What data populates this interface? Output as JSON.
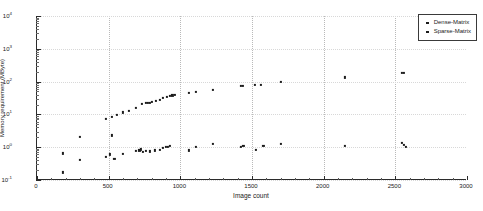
{
  "chart_data": {
    "type": "scatter",
    "title": "",
    "xlabel": "Image count",
    "ylabel": "Memory requirement (MByte)",
    "xlim": [
      0,
      3000
    ],
    "ylim": [
      0.1,
      10000
    ],
    "yscale": "log",
    "xscale": "linear",
    "grid": true,
    "grid_axis": "x",
    "legend_position": "top-right",
    "xticks": [
      0,
      500,
      1000,
      1500,
      2000,
      2500,
      3000
    ],
    "xticklabels": [
      "0",
      "500",
      "1000",
      "1500",
      "2000",
      "2500",
      "3000"
    ],
    "yticks": [
      0.1,
      1,
      10,
      100,
      1000,
      10000
    ],
    "yticklabels": [
      "10-1",
      "100",
      "101",
      "102",
      "103",
      "104"
    ],
    "ytick_exponents": [
      -1,
      0,
      1,
      2,
      3,
      4
    ],
    "series": [
      {
        "name": "Dense-Matrix",
        "marker": "square",
        "color": "#1c1c1c",
        "points": [
          [
            180,
            0.65
          ],
          [
            300,
            2.1
          ],
          [
            480,
            7.2
          ],
          [
            520,
            8.6
          ],
          [
            560,
            9.5
          ],
          [
            600,
            11.5
          ],
          [
            640,
            13.0
          ],
          [
            690,
            15.5
          ],
          [
            730,
            21.0
          ],
          [
            760,
            22.0
          ],
          [
            775,
            22.5
          ],
          [
            790,
            23.0
          ],
          [
            800,
            23.5
          ],
          [
            830,
            26.0
          ],
          [
            855,
            28.0
          ],
          [
            880,
            31.0
          ],
          [
            905,
            34.0
          ],
          [
            925,
            36.0
          ],
          [
            945,
            38.0
          ],
          [
            960,
            39.0
          ],
          [
            1060,
            45.0
          ],
          [
            1110,
            48.0
          ],
          [
            1230,
            55.0
          ],
          [
            1420,
            72.0
          ],
          [
            1435,
            73.0
          ],
          [
            1520,
            78.0
          ],
          [
            1560,
            80.0
          ],
          [
            1700,
            98.0
          ],
          [
            2150,
            135.0
          ],
          [
            2545,
            180.0
          ],
          [
            2560,
            182.0
          ]
        ]
      },
      {
        "name": "Sparse-Matrix",
        "marker": "square",
        "color": "#1c1c1c",
        "points": [
          [
            180,
            0.17
          ],
          [
            300,
            0.42
          ],
          [
            480,
            0.52
          ],
          [
            510,
            0.6
          ],
          [
            525,
            2.3
          ],
          [
            540,
            0.45
          ],
          [
            600,
            0.62
          ],
          [
            690,
            0.75
          ],
          [
            715,
            0.8
          ],
          [
            725,
            0.86
          ],
          [
            740,
            0.72
          ],
          [
            760,
            0.78
          ],
          [
            790,
            0.74
          ],
          [
            820,
            0.8
          ],
          [
            855,
            0.84
          ],
          [
            880,
            0.95
          ],
          [
            900,
            1.0
          ],
          [
            915,
            1.05
          ],
          [
            925,
            1.08
          ],
          [
            1060,
            0.8
          ],
          [
            1110,
            1.05
          ],
          [
            1230,
            1.25
          ],
          [
            1420,
            1.05
          ],
          [
            1440,
            1.07
          ],
          [
            1530,
            0.85
          ],
          [
            1580,
            1.1
          ],
          [
            1700,
            1.25
          ],
          [
            2150,
            1.1
          ],
          [
            2545,
            1.35
          ],
          [
            2560,
            1.2
          ],
          [
            2575,
            1.05
          ]
        ]
      }
    ]
  }
}
